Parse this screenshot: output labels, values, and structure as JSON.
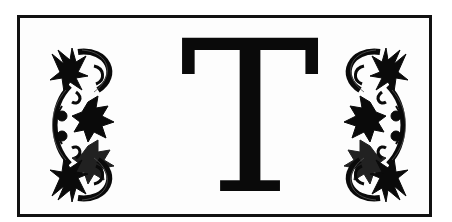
{
  "initial": {
    "letter": "T",
    "ornaments": [
      "fleur-de-lis-ornament-left",
      "fleur-de-lis-ornament-right"
    ]
  },
  "colors": {
    "ink": "#0a0a0a",
    "paper": "#fdfdfd",
    "frame": "#111111"
  }
}
